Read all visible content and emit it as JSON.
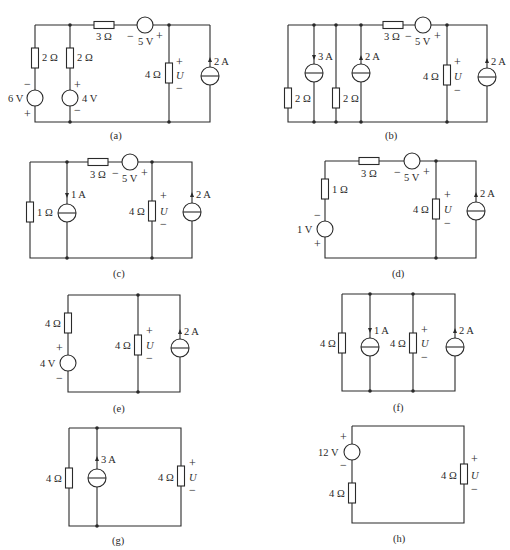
{
  "figure": {
    "panels": [
      {
        "id": "a",
        "caption": "(a)",
        "labels": {
          "r1": "2 Ω",
          "r2": "2 Ω",
          "r3": "3 Ω",
          "vs_series": "5 V",
          "vs1": "6 V",
          "vs2": "4 V",
          "r_load": "4 Ω",
          "u": "U",
          "is": "2 A"
        }
      },
      {
        "id": "b",
        "caption": "(b)",
        "labels": {
          "is1": "3 A",
          "is2": "2 A",
          "r1": "2 Ω",
          "r2": "2 Ω",
          "r3": "3 Ω",
          "vs_series": "5 V",
          "r_load": "4 Ω",
          "u": "U",
          "is": "2 A"
        }
      },
      {
        "id": "c",
        "caption": "(c)",
        "labels": {
          "r1": "1 Ω",
          "is1": "1 A",
          "r3": "3 Ω",
          "vs_series": "5 V",
          "r_load": "4 Ω",
          "u": "U",
          "is": "2 A"
        }
      },
      {
        "id": "d",
        "caption": "(d)",
        "labels": {
          "r1": "1 Ω",
          "vs1": "1 V",
          "r3": "3 Ω",
          "vs_series": "5 V",
          "r_load": "4 Ω",
          "u": "U",
          "is": "2 A"
        }
      },
      {
        "id": "e",
        "caption": "(e)",
        "labels": {
          "r1": "4 Ω",
          "vs1": "4 V",
          "r_load": "4 Ω",
          "u": "U",
          "is": "2 A"
        }
      },
      {
        "id": "f",
        "caption": "(f)",
        "labels": {
          "r1": "4 Ω",
          "is1": "1 A",
          "r_load": "4 Ω",
          "u": "U",
          "is": "2 A"
        }
      },
      {
        "id": "g",
        "caption": "(g)",
        "labels": {
          "r1": "4 Ω",
          "is1": "3 A",
          "r_load": "4 Ω",
          "u": "U"
        }
      },
      {
        "id": "h",
        "caption": "(h)",
        "labels": {
          "vs1": "12 V",
          "r1": "4 Ω",
          "r_load": "4 Ω",
          "u": "U"
        }
      }
    ],
    "polarity": {
      "plus": "+",
      "minus": "−"
    }
  }
}
